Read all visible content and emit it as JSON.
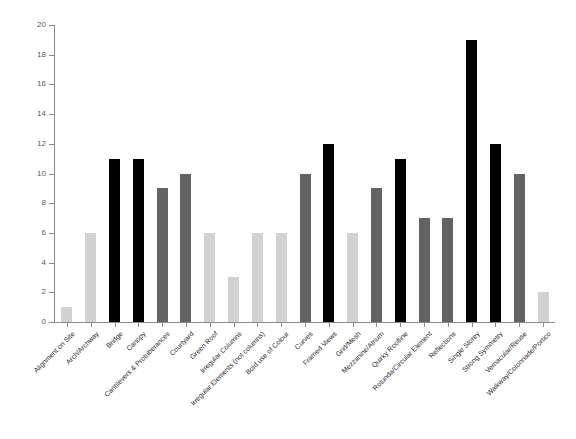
{
  "chart_data": {
    "type": "bar",
    "title": "",
    "subtitle": "",
    "xlabel": "",
    "ylabel": "",
    "ylim": [
      0,
      20
    ],
    "ytick_step": 2,
    "yticks": [
      0,
      2,
      4,
      6,
      8,
      10,
      12,
      14,
      16,
      18,
      20
    ],
    "grid": false,
    "legend": "none",
    "categories": [
      "Alignment on Site",
      "Arch/Archway",
      "Bridge",
      "Canopy",
      "Cantilevers & Protuberances",
      "Courtyard",
      "Green Roof",
      "Irregular Columns",
      "Irregular Elements (not columns)",
      "Bold use of Colour",
      "Curves",
      "Framed Views",
      "Grid/Mesh",
      "Mezzanine/Atrium",
      "Quirky Roofline",
      "Rotunda/Circular Element",
      "Reflections",
      "Single Storey",
      "Strong Symmetry",
      "Vernacular/Reuse",
      "Walkway/Colonnade/Portico"
    ],
    "values": [
      1,
      6,
      11,
      11,
      9,
      10,
      6,
      3,
      6,
      6,
      10,
      12,
      6,
      9,
      11,
      7,
      7,
      19,
      12,
      10,
      2
    ],
    "bar_shades": [
      "light",
      "light",
      "dark",
      "dark",
      "mid",
      "mid",
      "light",
      "light",
      "light",
      "light",
      "mid",
      "dark",
      "light",
      "mid",
      "dark",
      "mid",
      "mid",
      "dark",
      "dark",
      "mid",
      "light"
    ]
  },
  "colors": {
    "light": "#d2d2d2",
    "mid": "#636363",
    "dark": "#000000",
    "axis": "#8c8c8c",
    "tick_text": "#5a5a5a",
    "label_text": "#2b2b2b",
    "background": "#ffffff"
  }
}
